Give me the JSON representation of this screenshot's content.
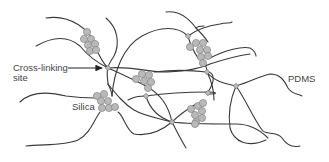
{
  "diagram": {
    "labels": {
      "cross_linking_line1": "Cross-linking",
      "cross_linking_line2": "site",
      "silica": "Silica",
      "pdms": "PDMS"
    },
    "colors": {
      "chain": "#3a3a3a",
      "particle_fill": "#b9b9b9",
      "particle_stroke": "#7a7a7a",
      "text": "#444444",
      "background": "#ffffff"
    },
    "legend_items": [
      {
        "name": "cross-linking-site",
        "label": "Cross-linking site",
        "pointer": "arrow"
      },
      {
        "name": "silica-particles",
        "label": "Silica"
      },
      {
        "name": "pdms-chain",
        "label": "PDMS"
      }
    ],
    "silica_clusters": 5,
    "cross_linking_sites": 6
  }
}
